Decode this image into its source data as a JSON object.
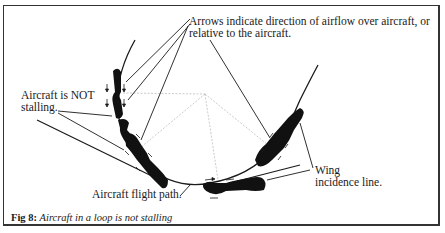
{
  "figure": {
    "annotations": {
      "arrows_note_line1": "Arrows indicate direction of airflow over aircraft, or",
      "arrows_note_line2": "relative to the aircraft.",
      "not_stalling_line1": "Aircraft is NOT",
      "not_stalling_line2": "stalling.",
      "flight_path": "Aircraft flight path.",
      "wing_incidence_line1": "Wing",
      "wing_incidence_line2": "incidence line."
    },
    "caption": {
      "label": "Fig 8:",
      "text": "Aircraft in a loop is not stalling"
    },
    "colors": {
      "ink": "#1a1a1a",
      "guide_lines": "#bdbdbd",
      "frame": "#333333"
    }
  }
}
